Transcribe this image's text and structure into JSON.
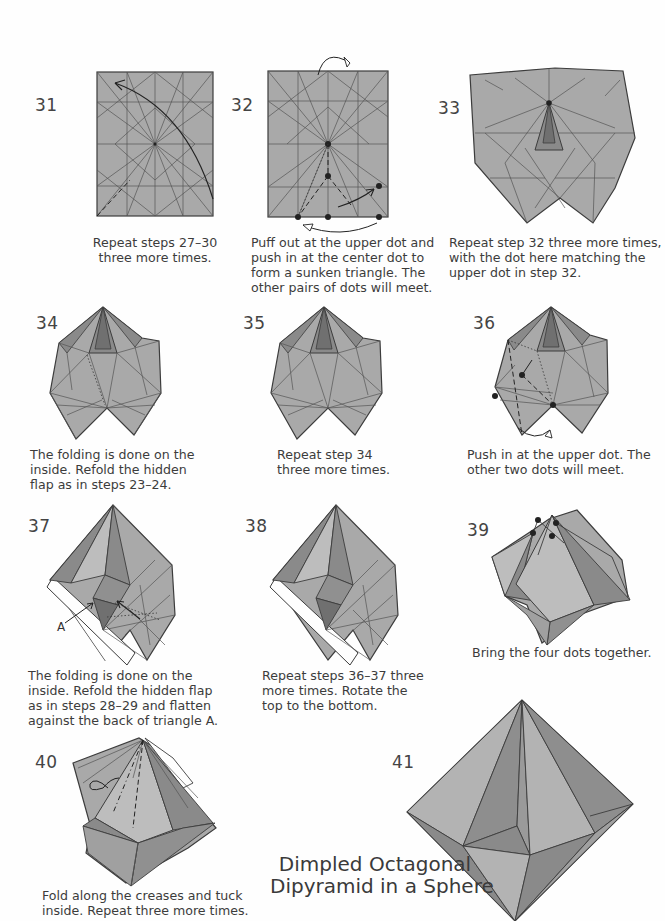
{
  "page": {
    "colors": {
      "paper": "#a9a9a9",
      "paper_dark": "#8a8a8a",
      "paper_darker": "#707070",
      "paper_light": "#bdbdbd",
      "line": "#3c3c3c",
      "background": "#fefefe"
    },
    "title": {
      "line1": "Dimpled Octagonal",
      "line2": "Dipyramid in a Sphere"
    },
    "steps": [
      {
        "number": "31",
        "caption": [
          "Repeat steps 27–30",
          "three more times."
        ]
      },
      {
        "number": "32",
        "caption": [
          "Puff out at the upper dot and",
          "push in at the center dot to",
          "form a sunken triangle. The",
          "other pairs of dots will meet."
        ]
      },
      {
        "number": "33",
        "caption": [
          "Repeat step 32 three more times,",
          "with the dot here matching the",
          "upper dot in step 32."
        ]
      },
      {
        "number": "34",
        "caption": [
          "The folding is done on the",
          "inside. Refold the hidden",
          "flap as in steps 23–24."
        ]
      },
      {
        "number": "35",
        "caption": [
          "Repeat step 34",
          "three more times."
        ]
      },
      {
        "number": "36",
        "caption": [
          "Push in at the upper dot. The",
          "other two dots will meet."
        ]
      },
      {
        "number": "37",
        "caption": [
          "The folding is done on the",
          "inside. Refold the hidden flap",
          "as in steps 28–29 and flatten",
          "against the back of triangle A."
        ],
        "label": "A"
      },
      {
        "number": "38",
        "caption": [
          "Repeat steps 36–37 three",
          "more times. Rotate the",
          "top to the bottom."
        ]
      },
      {
        "number": "39",
        "caption": [
          "Bring the four dots together."
        ]
      },
      {
        "number": "40",
        "caption": [
          "Fold along the creases and tuck",
          "inside. Repeat three more times."
        ]
      },
      {
        "number": "41",
        "caption": []
      }
    ]
  }
}
